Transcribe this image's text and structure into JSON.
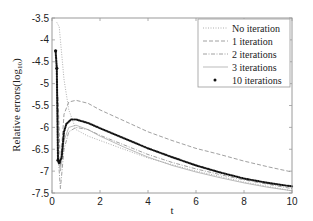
{
  "chart_data": {
    "type": "line",
    "title": "",
    "xlabel": "t",
    "ylabel": "Relative errors(log10)",
    "xlim": [
      0,
      10
    ],
    "ylim": [
      -7.5,
      -3.5
    ],
    "xticks": [
      0,
      2,
      4,
      6,
      8,
      10
    ],
    "yticks": [
      -3.5,
      -4,
      -4.5,
      -5,
      -5.5,
      -6,
      -6.5,
      -7,
      -7.5
    ],
    "grid": false,
    "legend_position": "upper right",
    "series": [
      {
        "name": "No iteration",
        "style": "dotted",
        "color": "#9a9a9a",
        "x": [
          0.2,
          0.3,
          0.5,
          0.7,
          1.0,
          1.5,
          2,
          3,
          4,
          5,
          6,
          7,
          8,
          9,
          10
        ],
        "values": [
          -3.6,
          -3.7,
          -4.9,
          -5.6,
          -6.05,
          -6.2,
          -6.3,
          -6.5,
          -6.7,
          -6.85,
          -7.0,
          -7.12,
          -7.25,
          -7.35,
          -7.45
        ]
      },
      {
        "name": "1 iteration",
        "style": "dashed",
        "color": "#888888",
        "x": [
          0.25,
          0.35,
          0.5,
          0.7,
          1.0,
          1.5,
          2,
          3,
          4,
          5,
          6,
          7,
          8,
          9,
          10
        ],
        "values": [
          -5.3,
          -6.9,
          -5.7,
          -5.42,
          -5.38,
          -5.45,
          -5.6,
          -5.85,
          -6.1,
          -6.3,
          -6.48,
          -6.62,
          -6.77,
          -6.9,
          -7.02
        ]
      },
      {
        "name": "2 iterations",
        "style": "dashdot",
        "color": "#888888",
        "x": [
          0.25,
          0.35,
          0.5,
          0.7,
          1.0,
          1.5,
          2,
          3,
          4,
          5,
          6,
          7,
          8,
          9,
          10
        ],
        "values": [
          -6.6,
          -7.4,
          -6.5,
          -6.1,
          -6.0,
          -6.05,
          -6.18,
          -6.4,
          -6.62,
          -6.8,
          -6.95,
          -7.08,
          -7.2,
          -7.3,
          -7.4
        ]
      },
      {
        "name": "3 iterations",
        "style": "solid",
        "color": "#aaaaaa",
        "x": [
          0.25,
          0.35,
          0.5,
          0.7,
          1.0,
          1.5,
          2,
          3,
          4,
          5,
          6,
          7,
          8,
          9,
          10
        ],
        "values": [
          -6.7,
          -7.0,
          -6.3,
          -6.0,
          -5.95,
          -6.05,
          -6.2,
          -6.45,
          -6.68,
          -6.87,
          -7.02,
          -7.15,
          -7.27,
          -7.37,
          -7.45
        ]
      },
      {
        "name": "10 iterations",
        "style": "markers",
        "color": "#111111",
        "x": [
          0.15,
          0.2,
          0.25,
          0.3,
          0.4,
          0.5,
          0.6,
          0.8,
          1.0,
          1.5,
          2,
          3,
          4,
          5,
          6,
          7,
          8,
          9,
          10
        ],
        "values": [
          -4.25,
          -4.65,
          -6.75,
          -6.8,
          -6.7,
          -6.1,
          -5.92,
          -5.82,
          -5.82,
          -5.9,
          -6.02,
          -6.25,
          -6.48,
          -6.68,
          -6.87,
          -7.03,
          -7.17,
          -7.27,
          -7.35
        ]
      }
    ]
  },
  "legend": {
    "items": [
      "No iteration",
      "1 iteration",
      "2 iterations",
      "3 iterations",
      "10 iterations"
    ]
  },
  "colors": {
    "axis": "#9a9a9a",
    "text": "#222222",
    "background": "#ffffff"
  }
}
